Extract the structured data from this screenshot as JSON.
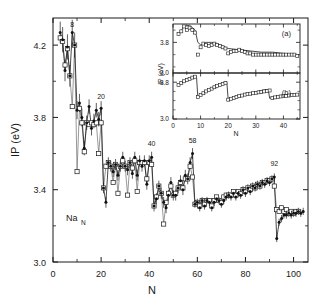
{
  "figure": {
    "species_label": "Na",
    "species_subscript": "N"
  },
  "chart_data": {
    "type": "scatter",
    "title": "",
    "xlabel": "N",
    "ylabel": "IP (eV)",
    "xlim": [
      0,
      106
    ],
    "ylim": [
      3.0,
      4.35
    ],
    "xticks": [
      0,
      20,
      40,
      60,
      80,
      100
    ],
    "xticklabels": [
      "0",
      "20",
      "40",
      "60",
      "80",
      "100"
    ],
    "yticks": [
      3.0,
      3.4,
      3.8,
      4.2
    ],
    "yticklabels": [
      "3.0",
      "3.4",
      "3.8",
      "4.2"
    ],
    "grid": false,
    "legend_position": "none",
    "annotations": [
      {
        "text": "8",
        "x": 8,
        "y": 4.3
      },
      {
        "text": "20",
        "x": 20,
        "y": 3.9
      },
      {
        "text": "40",
        "x": 41,
        "y": 3.64
      },
      {
        "text": "58",
        "x": 58,
        "y": 3.66
      },
      {
        "text": "92",
        "x": 92,
        "y": 3.53
      }
    ],
    "series": [
      {
        "name": "experiment",
        "marker": "filled-circle",
        "x": [
          3,
          4,
          5,
          6,
          7,
          8,
          9,
          10,
          11,
          12,
          13,
          14,
          15,
          16,
          17,
          18,
          19,
          20,
          21,
          22,
          23,
          24,
          25,
          26,
          27,
          28,
          29,
          30,
          31,
          32,
          33,
          34,
          35,
          36,
          37,
          38,
          39,
          40,
          41,
          42,
          43,
          44,
          45,
          46,
          47,
          48,
          49,
          50,
          51,
          52,
          53,
          54,
          55,
          56,
          57,
          58,
          59,
          60,
          61,
          62,
          63,
          64,
          65,
          66,
          67,
          68,
          69,
          70,
          71,
          72,
          73,
          74,
          75,
          76,
          77,
          78,
          79,
          80,
          81,
          82,
          83,
          84,
          85,
          86,
          87,
          88,
          89,
          90,
          91,
          92,
          93,
          94,
          95,
          96,
          97,
          98,
          99,
          100,
          101,
          102,
          103,
          104
        ],
        "y": [
          4.27,
          4.23,
          4.06,
          4.19,
          4.03,
          4.27,
          4.2,
          3.84,
          3.88,
          3.8,
          3.63,
          3.77,
          3.86,
          3.74,
          3.78,
          3.84,
          3.79,
          3.85,
          3.41,
          3.33,
          3.55,
          3.53,
          3.5,
          3.54,
          3.48,
          3.53,
          3.58,
          3.53,
          3.51,
          3.55,
          3.49,
          3.58,
          3.48,
          3.56,
          3.53,
          3.56,
          3.43,
          3.56,
          3.58,
          3.31,
          3.35,
          3.42,
          3.38,
          3.33,
          3.3,
          3.37,
          3.44,
          3.37,
          3.37,
          3.41,
          3.45,
          3.4,
          3.48,
          3.46,
          3.55,
          3.6,
          3.32,
          3.33,
          3.3,
          3.34,
          3.31,
          3.34,
          3.33,
          3.3,
          3.33,
          3.35,
          3.34,
          3.32,
          3.34,
          3.36,
          3.37,
          3.36,
          3.38,
          3.36,
          3.38,
          3.37,
          3.4,
          3.38,
          3.41,
          3.39,
          3.42,
          3.41,
          3.43,
          3.42,
          3.44,
          3.43,
          3.45,
          3.44,
          3.46,
          3.47,
          3.13,
          3.22,
          3.24,
          3.26,
          3.26,
          3.27,
          3.26,
          3.27,
          3.27,
          3.28,
          3.27,
          3.28
        ],
        "yerr": [
          0.06,
          0.07,
          0.06,
          0.07,
          0.06,
          0.07,
          0.07,
          0.05,
          0.05,
          0.05,
          0.04,
          0.04,
          0.04,
          0.04,
          0.04,
          0.04,
          0.04,
          0.04,
          0.03,
          0.03,
          0.03,
          0.03,
          0.03,
          0.03,
          0.03,
          0.03,
          0.03,
          0.03,
          0.03,
          0.03,
          0.03,
          0.03,
          0.03,
          0.03,
          0.03,
          0.03,
          0.03,
          0.03,
          0.03,
          0.03,
          0.03,
          0.03,
          0.03,
          0.03,
          0.03,
          0.03,
          0.03,
          0.03,
          0.03,
          0.03,
          0.03,
          0.03,
          0.03,
          0.03,
          0.03,
          0.03,
          0.02,
          0.02,
          0.02,
          0.02,
          0.02,
          0.02,
          0.02,
          0.02,
          0.02,
          0.02,
          0.02,
          0.02,
          0.02,
          0.02,
          0.02,
          0.02,
          0.02,
          0.02,
          0.02,
          0.02,
          0.02,
          0.02,
          0.02,
          0.02,
          0.02,
          0.02,
          0.02,
          0.02,
          0.02,
          0.02,
          0.02,
          0.02,
          0.02,
          0.02,
          0.02,
          0.02,
          0.02,
          0.02,
          0.02,
          0.02,
          0.02,
          0.02,
          0.02,
          0.02,
          0.02,
          0.02
        ]
      },
      {
        "name": "theory",
        "marker": "open-square",
        "x": [
          3,
          4,
          5,
          6,
          7,
          8,
          9,
          10,
          11,
          12,
          13,
          14,
          15,
          16,
          17,
          18,
          19,
          20,
          21,
          22,
          23,
          24,
          25,
          26,
          27,
          28,
          29,
          30,
          31,
          32,
          33,
          34,
          35,
          36,
          37,
          38,
          39,
          40,
          41,
          42,
          43,
          44,
          45,
          46,
          47,
          48,
          49,
          50,
          51,
          52,
          53,
          54,
          55,
          56,
          57,
          58,
          59,
          60,
          61,
          62,
          63,
          64,
          65,
          66,
          67,
          68,
          69,
          70,
          71,
          72,
          73,
          74,
          75,
          76,
          77,
          78,
          79,
          80,
          81,
          82,
          83,
          84,
          85,
          86,
          87,
          88,
          89,
          90,
          91,
          92,
          93,
          94,
          95,
          96,
          97,
          98,
          99,
          100,
          101,
          102
        ],
        "y": [
          4.24,
          4.22,
          4.09,
          4.18,
          4.03,
          3.86,
          4.2,
          3.5,
          3.85,
          3.77,
          3.61,
          3.77,
          3.76,
          3.77,
          3.76,
          3.77,
          3.6,
          3.77,
          3.41,
          3.53,
          3.55,
          3.53,
          3.44,
          3.54,
          3.38,
          3.53,
          3.56,
          3.53,
          3.37,
          3.55,
          3.52,
          3.56,
          3.39,
          3.55,
          3.55,
          3.55,
          3.46,
          3.55,
          3.54,
          3.31,
          3.36,
          3.42,
          3.38,
          3.21,
          3.33,
          3.38,
          3.42,
          3.37,
          3.38,
          3.41,
          3.44,
          3.41,
          3.46,
          3.46,
          3.53,
          3.47,
          3.32,
          3.33,
          3.31,
          3.34,
          3.32,
          3.34,
          3.34,
          3.31,
          3.34,
          3.36,
          3.34,
          3.33,
          3.36,
          3.37,
          3.37,
          3.37,
          3.39,
          3.37,
          3.39,
          3.38,
          3.4,
          3.39,
          3.41,
          3.4,
          3.42,
          3.41,
          3.43,
          3.42,
          3.44,
          3.44,
          3.45,
          3.45,
          3.46,
          3.42,
          3.29,
          3.28,
          3.3,
          3.28,
          3.29,
          3.27,
          3.28,
          3.27,
          3.28,
          3.28
        ]
      }
    ]
  },
  "insets": [
    {
      "tag": "(a)",
      "type": "scatter",
      "xlabel": "",
      "ylabel": "IP (eV)",
      "xlim": [
        0,
        46
      ],
      "ylim": [
        3.55,
        3.95
      ],
      "xticks": [
        0,
        10,
        20,
        30,
        40
      ],
      "xticklabels": [
        "0",
        "10",
        "20",
        "30",
        "40"
      ],
      "yticks": [
        3.8
      ],
      "yticklabels": [
        "3.8"
      ],
      "series": [
        {
          "name": "data-a",
          "marker": "open-square",
          "x": [
            2,
            3,
            4,
            5,
            6,
            7,
            8,
            9,
            10,
            11,
            12,
            13,
            14,
            15,
            16,
            17,
            18,
            19,
            20,
            21,
            22,
            23,
            24,
            25,
            26,
            27,
            28,
            29,
            30,
            31,
            32,
            33,
            34,
            35,
            36,
            37,
            38,
            39,
            40,
            41,
            42,
            43,
            44,
            45
          ],
          "y": [
            3.87,
            3.89,
            3.93,
            3.9,
            3.92,
            3.9,
            3.88,
            3.7,
            3.76,
            3.79,
            3.78,
            3.77,
            3.78,
            3.79,
            3.78,
            3.77,
            3.76,
            3.75,
            3.71,
            3.72,
            3.73,
            3.73,
            3.74,
            3.73,
            3.72,
            3.71,
            3.71,
            3.7,
            3.7,
            3.7,
            3.7,
            3.7,
            3.7,
            3.7,
            3.7,
            3.7,
            3.7,
            3.7,
            3.7,
            3.7,
            3.7,
            3.7,
            3.7,
            3.69
          ]
        },
        {
          "name": "curve-a",
          "marker": "line",
          "x": [
            2,
            4,
            6,
            8,
            9,
            10,
            12,
            14,
            16,
            18,
            20,
            24,
            28,
            32,
            36,
            40,
            44,
            45
          ],
          "y": [
            3.86,
            3.93,
            3.94,
            3.9,
            3.8,
            3.78,
            3.8,
            3.8,
            3.79,
            3.77,
            3.75,
            3.74,
            3.73,
            3.72,
            3.72,
            3.71,
            3.7,
            3.7
          ]
        }
      ]
    },
    {
      "tag": "(b)",
      "type": "scatter",
      "xlabel": "N",
      "ylabel": "",
      "xlim": [
        0,
        46
      ],
      "ylim": [
        3.0,
        4.0
      ],
      "xticks": [
        0,
        10,
        20,
        30,
        40
      ],
      "xticklabels": [
        "0",
        "10",
        "20",
        "30",
        "40"
      ],
      "yticks": [
        3.0,
        3.8
      ],
      "yticklabels": [
        "3.0",
        "3.8"
      ],
      "top_label": "3.0",
      "series": [
        {
          "name": "data-b",
          "marker": "open-square",
          "x": [
            2,
            3,
            4,
            5,
            6,
            7,
            8,
            9,
            10,
            11,
            12,
            13,
            14,
            15,
            16,
            17,
            18,
            19,
            20,
            21,
            22,
            23,
            24,
            25,
            26,
            27,
            28,
            29,
            30,
            31,
            32,
            33,
            34,
            35,
            36,
            37,
            38,
            39,
            40,
            41,
            42,
            43,
            44,
            45
          ],
          "y": [
            3.74,
            3.78,
            3.82,
            3.85,
            3.87,
            3.9,
            3.92,
            3.48,
            3.52,
            3.56,
            3.6,
            3.63,
            3.66,
            3.69,
            3.72,
            3.74,
            3.76,
            3.78,
            3.42,
            3.44,
            3.46,
            3.48,
            3.5,
            3.51,
            3.53,
            3.54,
            3.55,
            3.56,
            3.57,
            3.58,
            3.59,
            3.6,
            3.61,
            3.62,
            3.46,
            3.47,
            3.48,
            3.49,
            3.5,
            3.5,
            3.51,
            3.52,
            3.52,
            3.53
          ]
        },
        {
          "name": "curve-b",
          "marker": "line",
          "x": [
            2,
            4,
            6,
            8,
            8.5,
            9,
            12,
            16,
            19,
            19.5,
            20,
            24,
            28,
            32,
            34,
            34.5,
            35,
            38,
            42,
            45
          ],
          "y": [
            3.73,
            3.82,
            3.88,
            3.93,
            3.93,
            3.47,
            3.6,
            3.72,
            3.8,
            3.8,
            3.41,
            3.5,
            3.56,
            3.62,
            3.64,
            3.64,
            3.45,
            3.48,
            3.52,
            3.54
          ]
        }
      ]
    }
  ]
}
